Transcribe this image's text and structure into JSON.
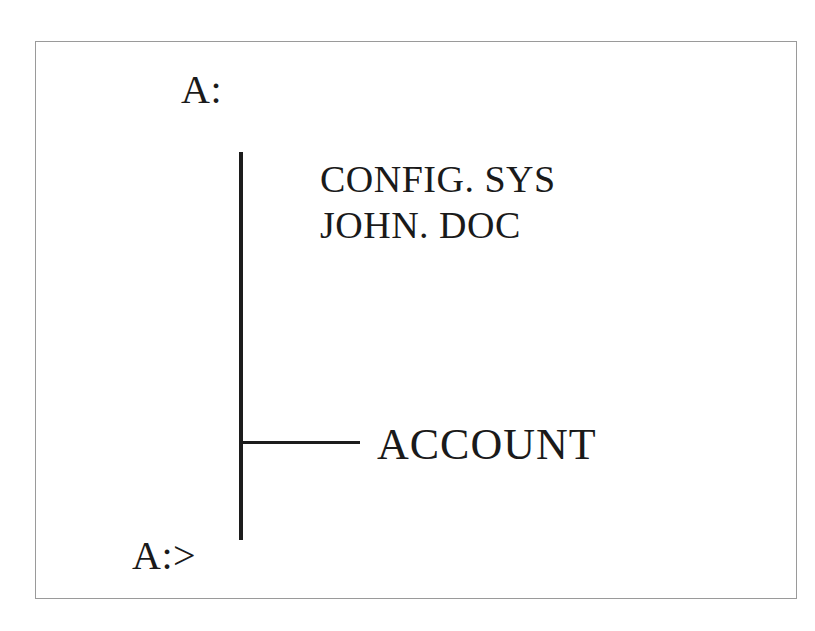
{
  "diagram": {
    "drive_label": "A:",
    "files": [
      {
        "name": "CONFIG. SYS"
      },
      {
        "name": "JOHN. DOC"
      }
    ],
    "subdirectory": "ACCOUNT",
    "prompt": "A:>",
    "colors": {
      "text": "#1a1a1a",
      "lines": "#1c1c1c",
      "frame_border": "#9a9a9a",
      "background": "#ffffff"
    }
  }
}
